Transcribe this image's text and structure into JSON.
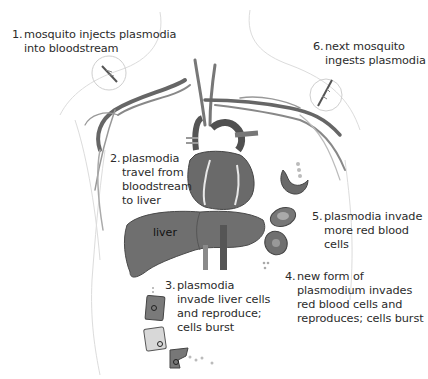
{
  "diagram": {
    "steps": [
      {
        "number": "1.",
        "lines": [
          "mosquito injects plasmodia",
          "into bloodstream"
        ]
      },
      {
        "number": "2.",
        "lines": [
          "plasmodia",
          "travel from",
          "bloodstream",
          "to liver"
        ]
      },
      {
        "number": "3.",
        "lines": [
          "plasmodia",
          "invade liver cells",
          "and reproduce;",
          "cells burst"
        ]
      },
      {
        "number": "4.",
        "lines": [
          "new form of",
          "plasmodium invades",
          "red blood cells and",
          "reproduces; cells burst"
        ]
      },
      {
        "number": "5.",
        "lines": [
          "plasmodia invade",
          "more red blood",
          "cells"
        ]
      },
      {
        "number": "6.",
        "lines": [
          "next mosquito",
          "ingests plasmodia"
        ]
      }
    ],
    "organ_labels": {
      "liver": "liver"
    },
    "colors": {
      "vessel": "#5a5a5a",
      "heart": "#6e6e6e",
      "liver": "#707070",
      "cell": "#7a7a7a",
      "outline": "#d0d0d0",
      "text": "#2b2b2b"
    }
  }
}
